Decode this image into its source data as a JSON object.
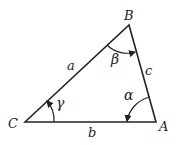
{
  "diagram": {
    "type": "triangle",
    "vertices": {
      "A": {
        "label": "A",
        "x": 156,
        "y": 122
      },
      "B": {
        "label": "B",
        "x": 129,
        "y": 25
      },
      "C": {
        "label": "C",
        "x": 25,
        "y": 122
      }
    },
    "sides": {
      "a": {
        "label": "a",
        "from": "C",
        "to": "B"
      },
      "b": {
        "label": "b",
        "from": "C",
        "to": "A"
      },
      "c": {
        "label": "c",
        "from": "B",
        "to": "A"
      }
    },
    "angles": {
      "alpha": {
        "label": "α",
        "vertex": "A"
      },
      "beta": {
        "label": "β",
        "vertex": "B"
      },
      "gamma": {
        "label": "γ",
        "vertex": "C"
      }
    },
    "colors": {
      "stroke": "#222222",
      "background": "#ffffff"
    }
  }
}
